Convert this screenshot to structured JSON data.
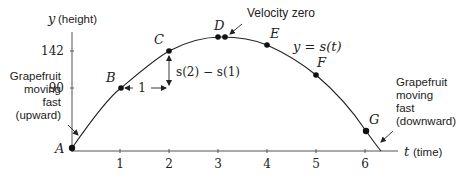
{
  "axes": {
    "y_label_var": "y",
    "y_label_text": "(height)",
    "x_label_var": "t",
    "x_label_text": "(time)",
    "y_ticks": [
      {
        "value": "142",
        "y": 51
      },
      {
        "value": "90",
        "y": 88
      }
    ],
    "x_ticks": [
      {
        "value": "1",
        "x": 120
      },
      {
        "value": "2",
        "x": 169
      },
      {
        "value": "3",
        "x": 218
      },
      {
        "value": "4",
        "x": 267
      },
      {
        "value": "5",
        "x": 316
      },
      {
        "value": "6",
        "x": 365
      }
    ]
  },
  "curve_label": "y = s(t)",
  "points": [
    {
      "label": "A",
      "t": 0,
      "x": 72,
      "y": 148
    },
    {
      "label": "B",
      "t": 1,
      "x": 121,
      "y": 88
    },
    {
      "label": "C",
      "t": 2,
      "x": 169,
      "y": 51
    },
    {
      "label": "D",
      "t": 3,
      "x": 218,
      "y": 37
    },
    {
      "label": "E",
      "t": 4,
      "x": 267,
      "y": 45
    },
    {
      "label": "F",
      "t": 5,
      "x": 316,
      "y": 75
    },
    {
      "label": "G",
      "t": 6,
      "x": 366,
      "y": 131
    }
  ],
  "annotations": {
    "velocity_zero": "Velocity zero",
    "delta_t": "1",
    "delta_s": "s(2) − s(1)",
    "upward_line1": "Grapefruit",
    "upward_line2": "moving",
    "upward_line3": "fast",
    "upward_line4": "(upward)",
    "downward_line1": "Grapefruit",
    "downward_line2": "moving",
    "downward_line3": "fast",
    "downward_line4": "(downward)"
  }
}
